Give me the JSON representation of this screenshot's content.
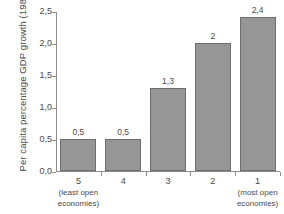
{
  "chart_data": {
    "type": "bar",
    "title": "",
    "xlabel": "",
    "ylabel": "Per capita percentage GDP growth (1980–98)",
    "categories": [
      "5",
      "4",
      "3",
      "2",
      "1"
    ],
    "category_sublabels": [
      "(least open economies)",
      "",
      "",
      "",
      "(most open economies)"
    ],
    "values": [
      0.5,
      0.5,
      1.3,
      2.0,
      2.4
    ],
    "value_labels": [
      "0,5",
      "0,5",
      "1,3",
      "2",
      "2,4"
    ],
    "ylim": [
      0.0,
      2.5
    ],
    "yticks": [
      0.0,
      0.5,
      1.0,
      1.5,
      2.0,
      2.5
    ],
    "ytick_labels": [
      "0,0",
      "0,5",
      "1,0",
      "1,5",
      "2,0",
      "2,5"
    ],
    "grid": false,
    "legend": null,
    "bar_color": "#969696",
    "bar_border_color": "#6e6e6e",
    "axis_color": "#8d8d8d",
    "text_color": "#4a4a4a",
    "background": "#ffffff"
  }
}
